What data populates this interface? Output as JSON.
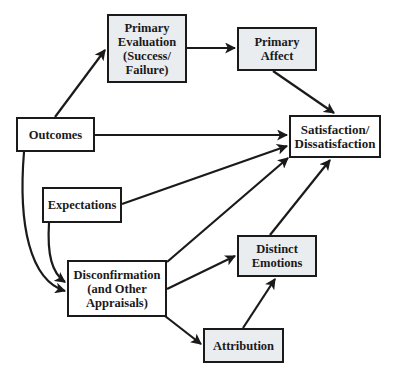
{
  "diagram": {
    "type": "flowchart",
    "nodes": [
      {
        "id": "outcomes",
        "label": "Outcomes",
        "style": "plain"
      },
      {
        "id": "primary_eval",
        "label": "Primary\nEvaluation\n(Success/\nFailure)",
        "style": "shaded"
      },
      {
        "id": "primary_affect",
        "label": "Primary\nAffect",
        "style": "shaded"
      },
      {
        "id": "satisfaction",
        "label": "Satisfaction/\nDissatisfaction",
        "style": "plain"
      },
      {
        "id": "expectations",
        "label": "Expectations",
        "style": "plain"
      },
      {
        "id": "disconfirmation",
        "label": "Disconfirmation\n(and Other\nAppraisals)",
        "style": "plain"
      },
      {
        "id": "distinct_emotions",
        "label": "Distinct\nEmotions",
        "style": "shaded"
      },
      {
        "id": "attribution",
        "label": "Attribution",
        "style": "shaded"
      }
    ],
    "edges": [
      {
        "from": "outcomes",
        "to": "primary_eval"
      },
      {
        "from": "primary_eval",
        "to": "primary_affect"
      },
      {
        "from": "primary_affect",
        "to": "satisfaction"
      },
      {
        "from": "outcomes",
        "to": "satisfaction"
      },
      {
        "from": "expectations",
        "to": "satisfaction"
      },
      {
        "from": "disconfirmation",
        "to": "satisfaction"
      },
      {
        "from": "distinct_emotions",
        "to": "satisfaction"
      },
      {
        "from": "outcomes",
        "to": "disconfirmation"
      },
      {
        "from": "expectations",
        "to": "disconfirmation"
      },
      {
        "from": "disconfirmation",
        "to": "distinct_emotions"
      },
      {
        "from": "disconfirmation",
        "to": "attribution"
      },
      {
        "from": "attribution",
        "to": "distinct_emotions"
      }
    ],
    "colors": {
      "stroke": "#1a1a1a",
      "shaded_fill": "#eaedf0",
      "plain_fill": "#ffffff"
    }
  }
}
